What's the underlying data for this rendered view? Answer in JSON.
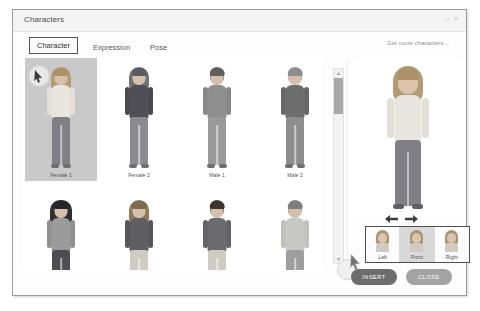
{
  "window": {
    "title": "Characters",
    "controls": [
      {
        "name": "minimize",
        "glyph": "–"
      },
      {
        "name": "close",
        "glyph": "×"
      }
    ]
  },
  "tabs": [
    {
      "id": "character",
      "label": "Character",
      "active": true
    },
    {
      "id": "expression",
      "label": "Expression",
      "active": false
    },
    {
      "id": "pose",
      "label": "Pose",
      "active": false
    }
  ],
  "links": {
    "get_more": "Get more characters..."
  },
  "grid": {
    "rows": 2,
    "cols": 4,
    "characters": [
      {
        "label": "Female 1",
        "selected": true,
        "hair": "#b39b72",
        "top": "#e9e6df",
        "bottom": "#7f7f85"
      },
      {
        "label": "Female 2",
        "selected": false,
        "hair": "#6f6f74",
        "top": "#4f4f55",
        "bottom": "#8a8a90"
      },
      {
        "label": "Male 1",
        "selected": false,
        "hair": "#6a6a6a",
        "top": "#8f8f8f",
        "bottom": "#9a9a9a"
      },
      {
        "label": "Male 2",
        "selected": false,
        "hair": "#9a9a9a",
        "top": "#6e6e6e",
        "bottom": "#8d8d8d"
      },
      {
        "label": "",
        "selected": false,
        "hair": "#2f2f33",
        "top": "#9b9b9b",
        "bottom": "#4e4e52"
      },
      {
        "label": "",
        "selected": false,
        "hair": "#8d7a5c",
        "top": "#5e5e63",
        "bottom": "#cfcbc3"
      },
      {
        "label": "",
        "selected": false,
        "hair": "#4a3f38",
        "top": "#6b6b70",
        "bottom": "#cfcbc3"
      },
      {
        "label": "",
        "selected": false,
        "hair": "#8a8a8a",
        "top": "#c8c8c4",
        "bottom": "#9e9e9e"
      }
    ]
  },
  "scrollbar": {
    "up_glyph": "▲",
    "down_glyph": "▼",
    "thumb_position_percent": 5
  },
  "preview": {
    "character_label": "Female 1"
  },
  "pose_selector": {
    "items": [
      {
        "id": "left",
        "label": "Left",
        "selected": false
      },
      {
        "id": "front",
        "label": "Front",
        "selected": true
      },
      {
        "id": "right",
        "label": "Right",
        "selected": false
      }
    ]
  },
  "footer": {
    "insert_label": "INSERT",
    "close_label": "CLOSE"
  },
  "colors": {
    "dialog_bg": "#fdfdfd",
    "titlebar_bg": "#f4f4f4",
    "selection_bg": "#c9c9c9",
    "primary_button": "#6d6d6d",
    "secondary_button": "#a3a3a3",
    "active_tab_border": "#545454"
  }
}
